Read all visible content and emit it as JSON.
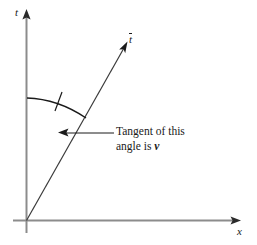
{
  "figure": {
    "kind": "minkowski-spacetime-diagram",
    "background_color": "#ffffff",
    "axis_color": "#8c8c8c",
    "line_color": "#1a1a1a",
    "text_color": "#1a1a1a",
    "axes": {
      "vertical": {
        "label": "t",
        "label_style": "italic",
        "arrow": "up"
      },
      "horizontal": {
        "label": "x",
        "label_style": "italic",
        "arrow": "right"
      }
    },
    "worldline": {
      "label_base": "t",
      "label_accent": "overbar",
      "label_full": "t̄",
      "arrow": "up-right"
    },
    "angle_arc": {
      "tick_marks": 1,
      "from": "t-axis",
      "to": "t-bar-axis"
    },
    "annotation": {
      "line1": "Tangent of this",
      "line2_prefix": "angle is ",
      "line2_symbol": "v",
      "leader": "arrow pointing left to the angle region"
    }
  }
}
